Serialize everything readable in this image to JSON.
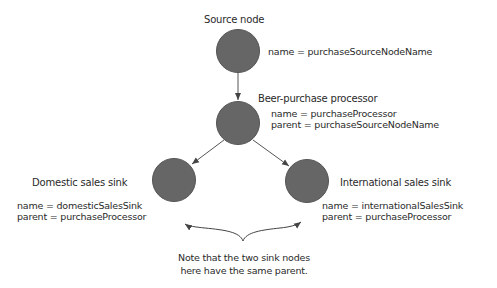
{
  "colors": {
    "node_fill": "#666666",
    "edge": "#444444",
    "text": "#2a2a2a"
  },
  "nodes": [
    {
      "id": "source",
      "title": "Source node",
      "props": [
        "name = purchaseSourceNodeName"
      ]
    },
    {
      "id": "processor",
      "title": "Beer-purchase processor",
      "props": [
        "name = purchaseProcessor",
        "parent = purchaseSourceNodeName"
      ]
    },
    {
      "id": "domestic",
      "title": "Domestic sales sink",
      "props": [
        "name = domesticSalesSink",
        "parent = purchaseProcessor"
      ]
    },
    {
      "id": "international",
      "title": "International sales sink",
      "props": [
        "name = internationalSalesSink",
        "parent = purchaseProcessor"
      ]
    }
  ],
  "edges": [
    {
      "from": "source",
      "to": "processor"
    },
    {
      "from": "processor",
      "to": "domestic"
    },
    {
      "from": "processor",
      "to": "international"
    }
  ],
  "annotation": {
    "lines": [
      "Note that the two sink nodes",
      "here have the same parent."
    ]
  }
}
